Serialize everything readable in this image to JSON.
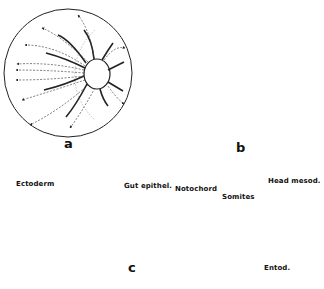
{
  "figure": {
    "panels": [
      {
        "id": "a",
        "label": "a",
        "description": "Spherical embryo with central circle; dashed arrows radiating outward (left), curved solid lines converging on central circle"
      },
      {
        "id": "b",
        "label": "b",
        "description": "Irregular mass joined to sphere; solid arrows streaming rightward into sphere with short arrows around periphery"
      },
      {
        "id": "c",
        "label": "c",
        "description": "Cross-section of embryo showing tissue layers with labeled structures"
      }
    ],
    "annotations": {
      "ectoderm": "Ectoderm",
      "gut_epithel": "Gut epithel.",
      "notochord": "Notochord",
      "somites": "Somites",
      "head_mesod": "Head mesod.",
      "entod": "Entod."
    }
  }
}
